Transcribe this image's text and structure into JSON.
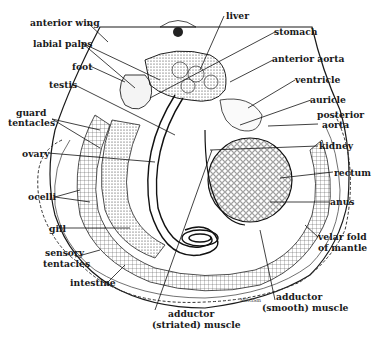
{
  "figure": {
    "signature": "MRGSm",
    "colors": {
      "ink": "#1a1a1a",
      "background": "#ffffff"
    }
  },
  "labels": {
    "anterior_wing": "anterior wing",
    "labial_palps": "labial palps",
    "foot": "foot",
    "testis": "testis",
    "guard_tentacles_1": "guard",
    "guard_tentacles_2": "tentacles",
    "ovary": "ovary",
    "ocelli": "ocelli",
    "gill": "gill",
    "sensory_tentacles_1": "sensory",
    "sensory_tentacles_2": "tentacles",
    "intestine": "intestine",
    "adductor_striated_1": "adductor",
    "adductor_striated_2": "(striated) muscle",
    "liver": "liver",
    "stomach": "stomach",
    "anterior_aorta": "anterior aorta",
    "ventricle": "ventricle",
    "auricle": "auricle",
    "posterior_aorta_1": "posterior",
    "posterior_aorta_2": "aorta",
    "kidney": "kidney",
    "rectum": "rectum",
    "anus": "anus",
    "velar_fold_1": "velar fold",
    "velar_fold_2": "of mantle",
    "adductor_smooth_1": "adductor",
    "adductor_smooth_2": "(smooth) muscle"
  }
}
